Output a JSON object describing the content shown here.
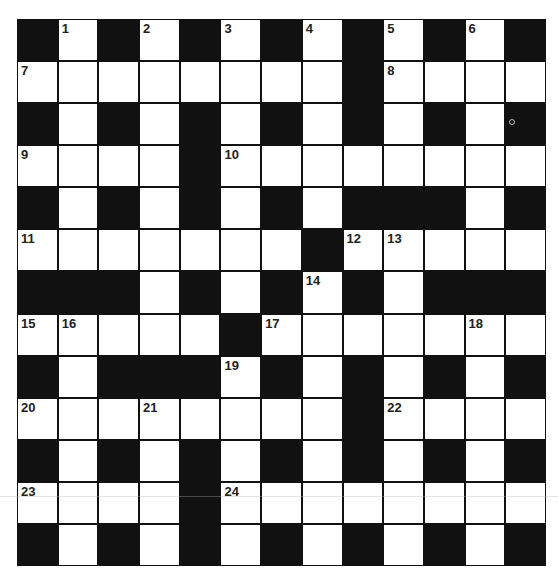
{
  "puzzle": {
    "rows": 13,
    "cols": 13,
    "colors": {
      "block": "#111111",
      "open": "#ffffff",
      "number": "#222222"
    },
    "layout": [
      "#.#.#.#.#.#.#",
      "........#....",
      "#.#.#.#.#.#.#",
      "....#........",
      "#.#.#.#.###.#",
      ".......#.....",
      "###.#.#.#.###",
      ".....#.......",
      "#.###.#.#.#.#",
      "........#....",
      "#.#.#.#.#.#.#",
      "....#........",
      "#.#.#.#.#.#.#"
    ],
    "numbers": [
      {
        "row": 0,
        "col": 1,
        "n": "1"
      },
      {
        "row": 0,
        "col": 3,
        "n": "2"
      },
      {
        "row": 0,
        "col": 5,
        "n": "3"
      },
      {
        "row": 0,
        "col": 7,
        "n": "4"
      },
      {
        "row": 0,
        "col": 9,
        "n": "5"
      },
      {
        "row": 0,
        "col": 11,
        "n": "6"
      },
      {
        "row": 1,
        "col": 0,
        "n": "7"
      },
      {
        "row": 1,
        "col": 9,
        "n": "8"
      },
      {
        "row": 3,
        "col": 0,
        "n": "9"
      },
      {
        "row": 3,
        "col": 5,
        "n": "10"
      },
      {
        "row": 5,
        "col": 0,
        "n": "11"
      },
      {
        "row": 5,
        "col": 8,
        "n": "12"
      },
      {
        "row": 5,
        "col": 9,
        "n": "13"
      },
      {
        "row": 6,
        "col": 7,
        "n": "14"
      },
      {
        "row": 7,
        "col": 0,
        "n": "15"
      },
      {
        "row": 7,
        "col": 1,
        "n": "16"
      },
      {
        "row": 7,
        "col": 6,
        "n": "17"
      },
      {
        "row": 7,
        "col": 11,
        "n": "18"
      },
      {
        "row": 8,
        "col": 5,
        "n": "19"
      },
      {
        "row": 9,
        "col": 0,
        "n": "20"
      },
      {
        "row": 9,
        "col": 3,
        "n": "21"
      },
      {
        "row": 9,
        "col": 9,
        "n": "22"
      },
      {
        "row": 11,
        "col": 0,
        "n": "23"
      },
      {
        "row": 11,
        "col": 5,
        "n": "24"
      }
    ],
    "entries": []
  }
}
